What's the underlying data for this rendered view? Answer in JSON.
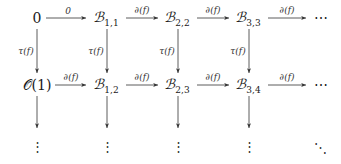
{
  "diagram": {
    "type": "commutative-diagram",
    "rows": [
      {
        "nodes": [
          {
            "base": "0",
            "sub": ""
          },
          {
            "base": "ℬ",
            "sub": "1,1"
          },
          {
            "base": "ℬ",
            "sub": "2,2"
          },
          {
            "base": "ℬ",
            "sub": "3,3"
          },
          {
            "base": "⋯",
            "sub": ""
          }
        ],
        "horizontal_labels": [
          "0",
          "∂(f)",
          "∂(f)",
          "∂(f)"
        ]
      },
      {
        "nodes": [
          {
            "base": "𝒪(1)",
            "sub": ""
          },
          {
            "base": "ℬ",
            "sub": "1,2"
          },
          {
            "base": "ℬ",
            "sub": "2,3"
          },
          {
            "base": "ℬ",
            "sub": "3,4"
          },
          {
            "base": "⋯",
            "sub": ""
          }
        ],
        "horizontal_labels": [
          "∂(f)",
          "∂(f)",
          "∂(f)",
          "∂(f)"
        ]
      }
    ],
    "vertical_labels_row1_to_row2": [
      "τ(f)",
      "τ(f)",
      "τ(f)",
      "τ(f)"
    ],
    "continuation": {
      "vertical_dots": "⋮",
      "diagonal_dots": "⋱"
    }
  }
}
